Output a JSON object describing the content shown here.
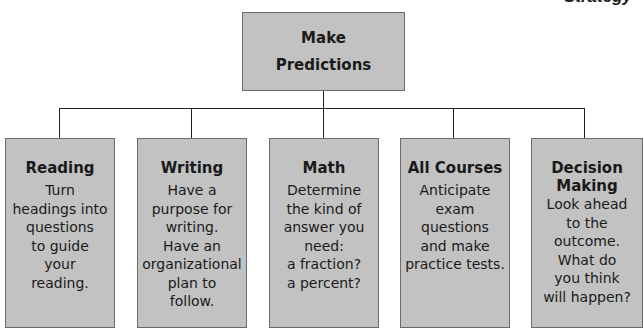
{
  "header": {
    "partial_title": "Strategy"
  },
  "root": {
    "line1": "Make",
    "line2": "Predictions"
  },
  "children": [
    {
      "heading": "Reading",
      "body": [
        "Turn",
        "headings into",
        "questions",
        "to guide",
        "your",
        "reading."
      ]
    },
    {
      "heading": "Writing",
      "body": [
        "Have a",
        "purpose for",
        "writing.",
        "Have an",
        "organizational",
        "plan to",
        "follow."
      ]
    },
    {
      "heading": "Math",
      "body": [
        "Determine",
        "the kind of",
        "answer you",
        "need:",
        "a fraction?",
        "a percent?"
      ]
    },
    {
      "heading": "All Courses",
      "body": [
        "Anticipate",
        "exam",
        "questions",
        "and make",
        "practice tests."
      ]
    },
    {
      "heading_lines": [
        "Decision",
        "Making"
      ],
      "body": [
        "Look ahead",
        "to the",
        "outcome.",
        "What do",
        "you think",
        "will happen?"
      ]
    }
  ],
  "colors": {
    "box_fill": "#c2c2c2",
    "box_border": "#6a6a6a",
    "text": "#1a1a1a",
    "connector": "#222222"
  }
}
